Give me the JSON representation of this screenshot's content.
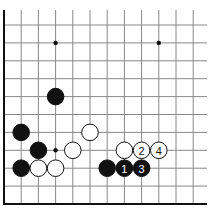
{
  "diagram": {
    "type": "go-board-corner",
    "corner": "bottom-left",
    "grid": {
      "origin_x": 4,
      "origin_y": 204,
      "col_spacing": 17.2,
      "row_spacing": 17.9,
      "cols_visible": 12,
      "rows_visible": 11,
      "right_extent": 207,
      "top_extent": 10
    },
    "colors": {
      "line": "#888888",
      "edge": "#111111",
      "black_stone": "#111111",
      "white_stone": "#ffffff",
      "stone_outline": "#111111",
      "black_label": "#ffffff",
      "white_label": "#111111"
    },
    "hoshi": [
      {
        "col": 3,
        "row": 3
      },
      {
        "col": 3,
        "row": 9
      },
      {
        "col": 9,
        "row": 9
      }
    ],
    "stones": [
      {
        "color": "black",
        "col": 3,
        "row": 6,
        "label": ""
      },
      {
        "color": "black",
        "col": 1,
        "row": 4,
        "label": ""
      },
      {
        "color": "black",
        "col": 2,
        "row": 3,
        "label": ""
      },
      {
        "color": "black",
        "col": 1,
        "row": 2,
        "label": ""
      },
      {
        "color": "white",
        "col": 2,
        "row": 2,
        "label": ""
      },
      {
        "color": "white",
        "col": 3,
        "row": 2,
        "label": ""
      },
      {
        "color": "white",
        "col": 4,
        "row": 3,
        "label": ""
      },
      {
        "color": "white",
        "col": 5,
        "row": 4,
        "label": ""
      },
      {
        "color": "white",
        "col": 7,
        "row": 3,
        "label": ""
      },
      {
        "color": "white",
        "col": 8,
        "row": 3,
        "label": "2"
      },
      {
        "color": "white",
        "col": 9,
        "row": 3,
        "label": "4"
      },
      {
        "color": "black",
        "col": 6,
        "row": 2,
        "label": ""
      },
      {
        "color": "black",
        "col": 7,
        "row": 2,
        "label": "1"
      },
      {
        "color": "black",
        "col": 8,
        "row": 2,
        "label": "3"
      }
    ]
  }
}
